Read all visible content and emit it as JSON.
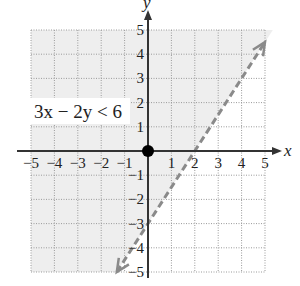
{
  "chart_data": {
    "type": "inequality-graph",
    "title": "",
    "annotation": "3x − 2y < 6",
    "inequality": {
      "expression": "3x - 2y < 6",
      "boundary_line": "y = 1.5x - 3",
      "boundary_style": "dashed",
      "shaded_side": "above-left",
      "x_intercept": 2,
      "y_intercept": -3,
      "test_point": [
        0,
        0
      ]
    },
    "xlabel": "x",
    "ylabel": "y",
    "xlim": [
      -5,
      5
    ],
    "ylim": [
      -5,
      5
    ],
    "x_ticks": [
      -5,
      -4,
      -3,
      -2,
      -1,
      1,
      2,
      3,
      4,
      5
    ],
    "y_ticks": [
      -5,
      -4,
      -3,
      -2,
      -1,
      1,
      2,
      3,
      4,
      5
    ],
    "x_tick_labels": [
      "−5",
      "−4",
      "−3",
      "−2",
      "−1",
      "1",
      "2",
      "3",
      "4",
      "5"
    ],
    "y_tick_labels": [
      "−5",
      "−4",
      "−3",
      "−2",
      "−1",
      "1",
      "2",
      "3",
      "4",
      "5"
    ],
    "grid": true,
    "grid_style": "dotted",
    "points": [
      {
        "x": 0,
        "y": 0,
        "style": "filled-dot"
      }
    ],
    "line_segment": {
      "from": [
        -1.333,
        -5
      ],
      "to": [
        5,
        4.5
      ]
    },
    "colors": {
      "shade": "#eeeeee",
      "grid": "#9a9a9a",
      "axis": "#333333",
      "boundary": "#8a8a8a",
      "point": "#000000"
    }
  }
}
